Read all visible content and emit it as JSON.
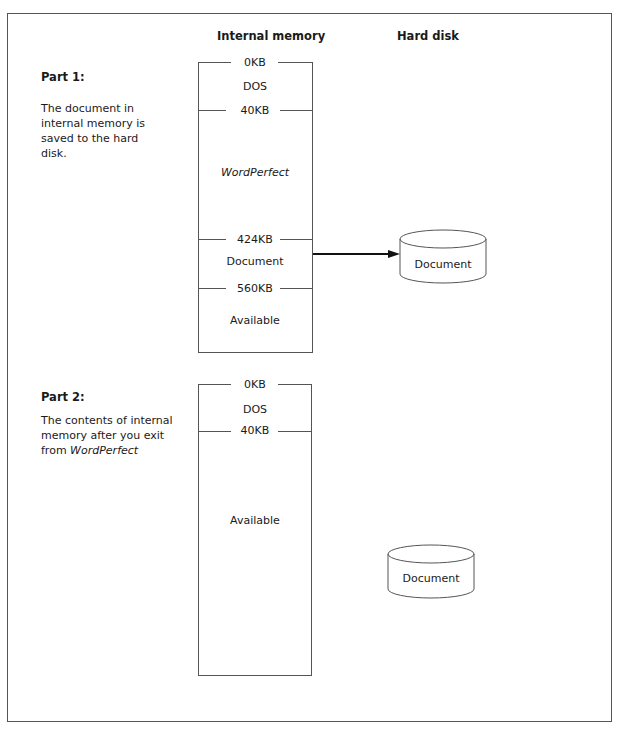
{
  "headers": {
    "internal_memory": "Internal memory",
    "hard_disk": "Hard disk"
  },
  "part1": {
    "title": "Part 1:",
    "description": "The document in internal memory is saved to the hard disk.",
    "memory_markers": [
      "0KB",
      "40KB",
      "424KB",
      "560KB"
    ],
    "segments": [
      "DOS",
      "WordPerfect",
      "Document",
      "Available"
    ],
    "disk_label": "Document"
  },
  "part2": {
    "title": "Part 2:",
    "description_prefix": "The contents of internal memory after you exit from ",
    "description_italic": "WordPerfect",
    "memory_markers": [
      "0KB",
      "40KB"
    ],
    "segments": [
      "DOS",
      "Available"
    ],
    "disk_label": "Document"
  }
}
